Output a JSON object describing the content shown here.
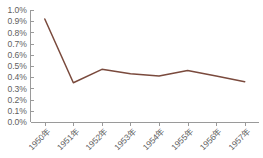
{
  "chart_data": {
    "type": "line",
    "title": "",
    "subtitle": "",
    "xlabel": "",
    "ylabel": "",
    "categories": [
      "1950年",
      "1951年",
      "1952年",
      "1953年",
      "1954年",
      "1955年",
      "1956年",
      "1957年"
    ],
    "values": [
      0.92,
      0.35,
      0.47,
      0.43,
      0.41,
      0.46,
      0.41,
      0.36
    ],
    "value_unit": "%",
    "ylim": [
      0.0,
      1.0
    ],
    "ytick_labels": [
      "1.0%",
      "0.9%",
      "0.8%",
      "0.7%",
      "0.6%",
      "0.5%",
      "0.4%",
      "0.3%",
      "0.2%",
      "0.1%",
      "0.0%"
    ],
    "ytick_values": [
      1.0,
      0.9,
      0.8,
      0.7,
      0.6,
      0.5,
      0.4,
      0.3,
      0.2,
      0.1,
      0.0
    ],
    "grid": false,
    "legend": false,
    "legend_position": "none",
    "series": [
      {
        "name": "",
        "color": "#7a4a3d",
        "values": [
          0.92,
          0.35,
          0.47,
          0.43,
          0.41,
          0.46,
          0.41,
          0.36
        ]
      }
    ],
    "colors": {
      "line": "#7a4a3d",
      "axis": "#9a9a9a",
      "tick_text": "#5f5f5f",
      "background": "#ffffff"
    },
    "xtick_label_rotation": -45
  }
}
